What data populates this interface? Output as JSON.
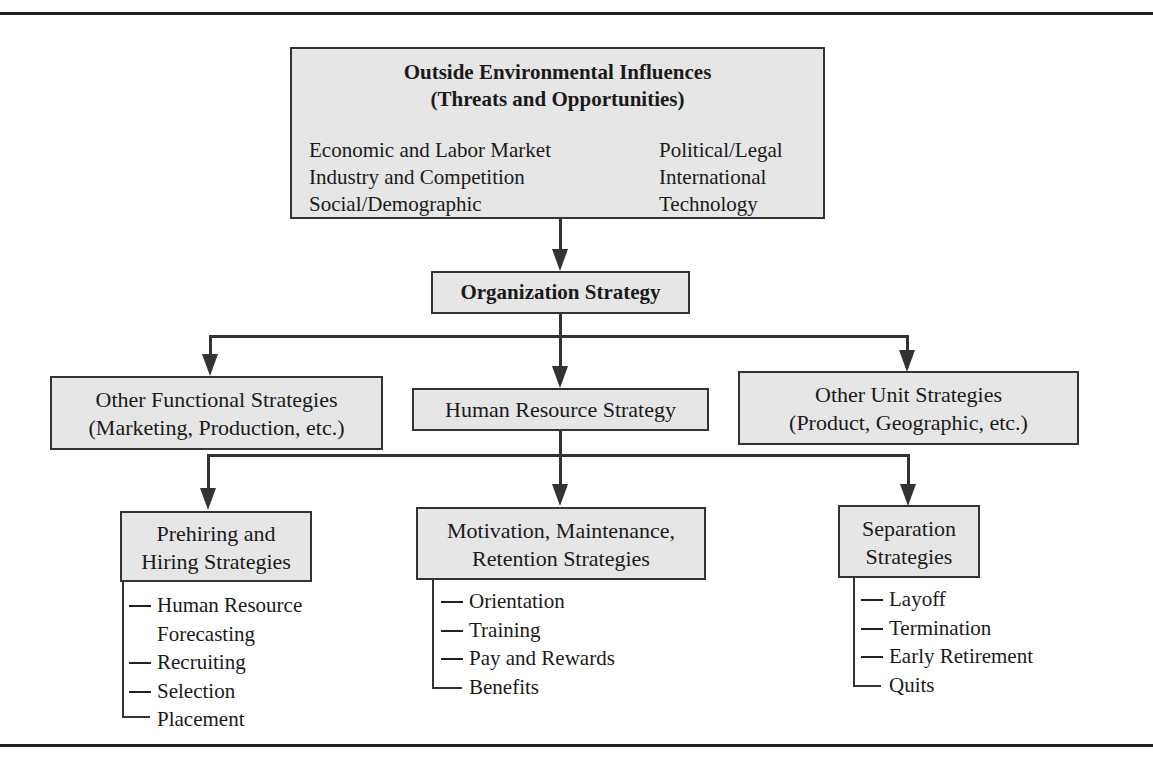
{
  "env": {
    "title_line1": "Outside Environmental Influences",
    "title_line2": "(Threats and Opportunities)",
    "left_items": [
      "Economic and Labor Market",
      "Industry and Competition",
      "Social/Demographic"
    ],
    "right_items": [
      "Political/Legal",
      "International",
      "Technology"
    ]
  },
  "org_strategy": {
    "label": "Organization Strategy"
  },
  "level2": {
    "functional": {
      "line1": "Other Functional Strategies",
      "line2": "(Marketing, Production, etc.)"
    },
    "hr": {
      "label": "Human Resource Strategy"
    },
    "unit": {
      "line1": "Other Unit Strategies",
      "line2": "(Product, Geographic, etc.)"
    }
  },
  "level3": {
    "prehiring": {
      "line1": "Prehiring and",
      "line2": "Hiring Strategies",
      "items": [
        "Human Resource",
        "Forecasting",
        "Recruiting",
        "Selection",
        "Placement"
      ]
    },
    "motivation": {
      "line1": "Motivation, Maintenance,",
      "line2": "Retention Strategies",
      "items": [
        "Orientation",
        "Training",
        "Pay and Rewards",
        "Benefits"
      ]
    },
    "separation": {
      "line1": "Separation",
      "line2": "Strategies",
      "items": [
        "Layoff",
        "Termination",
        "Early Retirement",
        "Quits"
      ]
    }
  },
  "colors": {
    "box_fill": "#e6e6e6",
    "line": "#333333"
  }
}
